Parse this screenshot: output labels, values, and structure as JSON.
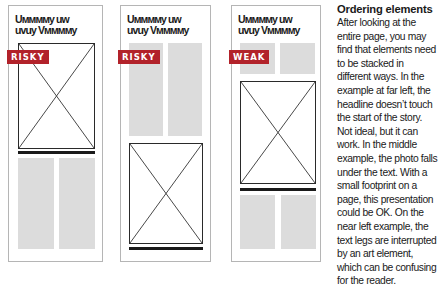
{
  "panels": [
    {
      "headline_line1": "Uмммму uw",
      "headline_line2": "uvuy Vммммy",
      "badge": "RISKY",
      "badge_color": "#b2222a"
    },
    {
      "headline_line1": "Uмммму uw",
      "headline_line2": "uvuy Vммммy",
      "badge": "RISKY",
      "badge_color": "#b2222a"
    },
    {
      "headline_line1": "Uмммму uw",
      "headline_line2": "uvuy Vммммy",
      "badge": "WEAK",
      "badge_color": "#b2222a"
    }
  ],
  "sidebar": {
    "title": "Ordering elements",
    "body": "After looking at the entire page, you may find that elements need to be stacked in different ways. In the example at far left, the headline doesn’t touch the start of the story. Not ideal, but it can work. In the middle example, the photo falls under the text. With a small footprint on a page, this presentation could be OK. On the near left example, the text legs are interrupted by an art element, which can be confusing for the reader."
  }
}
